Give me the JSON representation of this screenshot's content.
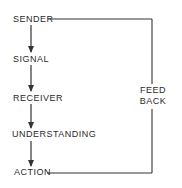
{
  "diagram": {
    "type": "communication-process-flow",
    "steps": [
      {
        "id": "sender",
        "label": "SENDER"
      },
      {
        "id": "signal",
        "label": "SIGNAL"
      },
      {
        "id": "receiver",
        "label": "RECEIVER"
      },
      {
        "id": "understanding",
        "label": "UNDERSTANDING"
      },
      {
        "id": "action",
        "label": "ACTION"
      }
    ],
    "feedback": {
      "line1": "FEED",
      "line2": "BACK",
      "from": "action",
      "to": "sender"
    },
    "colors": {
      "line": "#333333",
      "text": "#2a2a2a",
      "background": "#ffffff"
    }
  }
}
